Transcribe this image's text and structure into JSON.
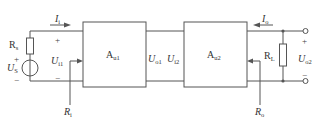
{
  "diagram": {
    "type": "two-stage amplifier block diagram",
    "stroke_color": "#555555",
    "source": {
      "resistor_label": "R",
      "resistor_sub": "s",
      "voltage_label": "U",
      "voltage_sub": "S",
      "plus": "+",
      "minus": "−"
    },
    "input": {
      "current_label": "I",
      "current_sub": "i",
      "voltage_label": "U",
      "voltage_sub": "i1",
      "resistance_label": "R",
      "resistance_sub": "i",
      "plus": "+",
      "minus": "−"
    },
    "stage1": {
      "label": "A",
      "sub": "u1"
    },
    "interstage": {
      "out1_label": "U",
      "out1_sub": "o1",
      "in2_label": "U",
      "in2_sub": "i2"
    },
    "stage2": {
      "label": "A",
      "sub": "u2"
    },
    "output": {
      "current_label": "I",
      "current_sub": "o",
      "load_label": "R",
      "load_sub": "L",
      "voltage_label": "U",
      "voltage_sub": "o2",
      "resistance_label": "R",
      "resistance_sub": "o",
      "plus": "+",
      "minus": "−"
    }
  }
}
